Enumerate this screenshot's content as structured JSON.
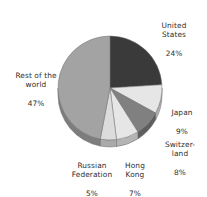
{
  "chart_data": {
    "type": "pie",
    "title": "",
    "subtitle": "",
    "xlabel": "",
    "ylabel": "",
    "legend_position": "none",
    "grid": false,
    "labels_outside": true,
    "style": "3d-pie",
    "categories": [
      "United States",
      "Japan",
      "Switzerland",
      "Hong Kong",
      "Russian Federation",
      "Rest of the world"
    ],
    "values": [
      24,
      9,
      8,
      7,
      5,
      47
    ],
    "value_suffix": "%",
    "slices": [
      {
        "name": "United States",
        "label_lines": [
          "United",
          "States"
        ],
        "value": 24,
        "value_text": "24%",
        "color": "#3a3a3a",
        "side_color": "#232323",
        "start_angle": 0,
        "end_angle": 86.4
      },
      {
        "name": "Japan",
        "label_lines": [
          "Japan"
        ],
        "value": 9,
        "value_text": "9%",
        "color": "#e6e6e6",
        "side_color": "#b4b4b4",
        "start_angle": 86.4,
        "end_angle": 118.8
      },
      {
        "name": "Switzerland",
        "label_lines": [
          "Switzer-",
          "land"
        ],
        "value": 8,
        "value_text": "8%",
        "color": "#808080",
        "side_color": "#5e5e5e",
        "start_angle": 118.8,
        "end_angle": 147.6
      },
      {
        "name": "Hong Kong",
        "label_lines": [
          "Hong",
          "Kong"
        ],
        "value": 7,
        "value_text": "7%",
        "color": "#e6e6e6",
        "side_color": "#b4b4b4",
        "start_angle": 147.6,
        "end_angle": 172.8
      },
      {
        "name": "Russian Federation",
        "label_lines": [
          "Russian",
          "Federation"
        ],
        "value": 5,
        "value_text": "5%",
        "color": "#dcdcdc",
        "side_color": "#aaaaaa",
        "start_angle": 172.8,
        "end_angle": 190.8
      },
      {
        "name": "Rest of the world",
        "label_lines": [
          "Rest of the",
          "world"
        ],
        "value": 47,
        "value_text": "47%",
        "color": "#a3a3a3",
        "side_color": "#7d7d7d",
        "start_angle": 190.8,
        "end_angle": 360
      }
    ],
    "geometry": {
      "center_x": 110,
      "center_y": 88,
      "radius_x": 52,
      "radius_y": 52,
      "depth": 7
    },
    "colors": {
      "background": "#ffffff",
      "text": "#2e2e2e",
      "outline": "#6e6e6e"
    }
  },
  "labels": {
    "united_states": {
      "name": "United\nStates",
      "value": "24%"
    },
    "japan": {
      "name": "Japan",
      "value": "9%"
    },
    "switzerland": {
      "name": "Switzer-\nland",
      "value": "8%"
    },
    "hong_kong": {
      "name": "Hong\nKong",
      "value": "7%"
    },
    "russian_federation": {
      "name": "Russian\nFederation",
      "value": "5%"
    },
    "rest_of_world": {
      "name": "Rest of the\nworld",
      "value": "47%"
    }
  }
}
